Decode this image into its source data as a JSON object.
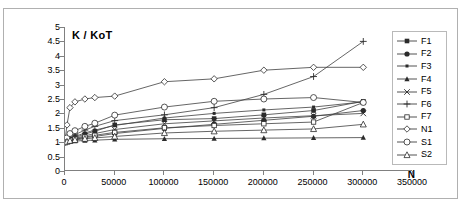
{
  "chart_data": {
    "type": "line",
    "title": "K / KoT",
    "xlabel": "N",
    "ylabel": "",
    "xlim": [
      0,
      350000
    ],
    "ylim": [
      0,
      5
    ],
    "xticks": [
      "0",
      "50000",
      "100000",
      "150000",
      "200000",
      "250000",
      "300000",
      "350000"
    ],
    "yticks": [
      "0",
      "0.5",
      "1",
      "1.5",
      "2",
      "2.5",
      "3",
      "3.5",
      "4",
      "4.5",
      "5"
    ],
    "grid": false,
    "legend_position": "right",
    "legend_entries": [
      "F1",
      "F2",
      "F3",
      "F4",
      "F5",
      "F6",
      "F7",
      "N1",
      "S1",
      "S2"
    ],
    "series": [
      {
        "name": "F1",
        "marker": "filled-square",
        "x": [
          0,
          2000,
          5000,
          10000,
          20000,
          30000,
          50000,
          100000,
          150000,
          200000,
          250000,
          300000
        ],
        "values": [
          1.0,
          1.05,
          1.1,
          1.16,
          1.28,
          1.38,
          1.6,
          1.78,
          1.82,
          1.95,
          2.1,
          2.42
        ]
      },
      {
        "name": "F2",
        "marker": "filled-circle",
        "x": [
          0,
          2000,
          5000,
          10000,
          20000,
          30000,
          50000,
          100000,
          150000,
          200000,
          250000,
          300000
        ],
        "values": [
          1.0,
          1.03,
          1.06,
          1.1,
          1.16,
          1.2,
          1.3,
          1.48,
          1.62,
          1.76,
          1.9,
          2.1
        ]
      },
      {
        "name": "F3",
        "marker": "small-filled-square",
        "x": [
          0,
          2000,
          5000,
          10000,
          20000,
          30000,
          50000,
          100000,
          150000,
          200000,
          250000,
          300000
        ],
        "values": [
          1.0,
          1.05,
          1.12,
          1.2,
          1.32,
          1.42,
          1.58,
          1.84,
          2.0,
          2.12,
          2.22,
          2.4
        ]
      },
      {
        "name": "F4",
        "marker": "filled-triangle",
        "x": [
          0,
          2000,
          5000,
          10000,
          20000,
          30000,
          50000,
          100000,
          150000,
          200000,
          250000,
          300000
        ],
        "values": [
          1.0,
          1.01,
          1.02,
          1.04,
          1.06,
          1.07,
          1.1,
          1.12,
          1.13,
          1.14,
          1.15,
          1.16
        ]
      },
      {
        "name": "F5",
        "marker": "x-cross",
        "x": [
          0,
          2000,
          5000,
          10000,
          20000,
          30000,
          50000,
          100000,
          150000,
          200000,
          250000,
          300000
        ],
        "values": [
          1.0,
          1.04,
          1.08,
          1.13,
          1.22,
          1.3,
          1.44,
          1.64,
          1.74,
          1.84,
          1.92,
          2.0
        ]
      },
      {
        "name": "F6",
        "marker": "plus",
        "x": [
          0,
          2000,
          5000,
          10000,
          20000,
          30000,
          50000,
          100000,
          150000,
          200000,
          250000,
          300000
        ],
        "values": [
          1.0,
          1.08,
          1.16,
          1.26,
          1.42,
          1.55,
          1.75,
          1.95,
          2.2,
          2.66,
          3.28,
          4.5
        ]
      },
      {
        "name": "F7",
        "marker": "open-square",
        "x": [
          0,
          2000,
          5000,
          10000,
          20000,
          30000,
          50000,
          100000,
          150000,
          200000,
          250000,
          300000
        ],
        "values": [
          1.0,
          1.03,
          1.07,
          1.11,
          1.18,
          1.24,
          1.34,
          1.5,
          1.58,
          1.64,
          1.7,
          2.38
        ]
      },
      {
        "name": "N1",
        "marker": "open-diamond",
        "x": [
          0,
          2000,
          5000,
          10000,
          20000,
          30000,
          50000,
          100000,
          150000,
          200000,
          250000,
          300000
        ],
        "values": [
          1.05,
          1.6,
          2.2,
          2.4,
          2.5,
          2.55,
          2.6,
          3.1,
          3.2,
          3.5,
          3.6,
          3.6
        ]
      },
      {
        "name": "S1",
        "marker": "open-circle",
        "x": [
          0,
          2000,
          5000,
          10000,
          20000,
          30000,
          50000,
          100000,
          150000,
          200000,
          250000,
          300000
        ],
        "values": [
          1.0,
          1.15,
          1.3,
          1.4,
          1.55,
          1.66,
          1.94,
          2.22,
          2.42,
          2.5,
          2.55,
          2.38
        ]
      },
      {
        "name": "S2",
        "marker": "open-triangle",
        "x": [
          0,
          2000,
          5000,
          10000,
          20000,
          30000,
          50000,
          100000,
          150000,
          200000,
          250000,
          300000
        ],
        "values": [
          1.0,
          1.02,
          1.05,
          1.08,
          1.12,
          1.15,
          1.2,
          1.32,
          1.38,
          1.42,
          1.46,
          1.62
        ]
      }
    ]
  }
}
